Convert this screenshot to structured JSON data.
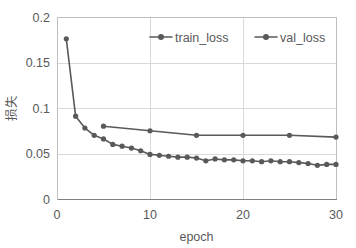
{
  "chart_data": {
    "type": "line",
    "title": "",
    "xlabel": "epoch",
    "ylabel": "损失",
    "xlim": [
      0,
      30
    ],
    "ylim": [
      0,
      0.2
    ],
    "xticks": [
      "0",
      "10",
      "20",
      "30"
    ],
    "xtick_values": [
      0,
      10,
      20,
      30
    ],
    "yticks": [
      "0",
      "0.05",
      "0.1",
      "0.15",
      "0.2"
    ],
    "ytick_values": [
      0,
      0.05,
      0.1,
      0.15,
      0.2
    ],
    "grid": "horizontal-and-vertical",
    "legend_position": "top-center-inside",
    "series": [
      {
        "name": "train_loss",
        "color": "#595959",
        "marker": "circle",
        "marker_every": 1,
        "x": [
          1,
          2,
          3,
          4,
          5,
          6,
          7,
          8,
          9,
          10,
          11,
          12,
          13,
          14,
          15,
          16,
          17,
          18,
          19,
          20,
          21,
          22,
          23,
          24,
          25,
          26,
          27,
          28,
          29,
          30
        ],
        "values": [
          0.176,
          0.091,
          0.078,
          0.07,
          0.066,
          0.06,
          0.058,
          0.056,
          0.053,
          0.049,
          0.048,
          0.047,
          0.046,
          0.046,
          0.045,
          0.042,
          0.044,
          0.043,
          0.043,
          0.042,
          0.042,
          0.041,
          0.042,
          0.041,
          0.041,
          0.04,
          0.039,
          0.037,
          0.038,
          0.038
        ]
      },
      {
        "name": "val_loss",
        "color": "#595959",
        "marker": "circle",
        "marker_every": 5,
        "x": [
          5,
          10,
          15,
          20,
          25,
          30
        ],
        "values": [
          0.08,
          0.075,
          0.07,
          0.07,
          0.07,
          0.068
        ]
      }
    ]
  },
  "legend": {
    "entries": [
      {
        "label": "train_loss"
      },
      {
        "label": "val_loss"
      }
    ]
  },
  "colors": {
    "series": "#595959",
    "grid": "#d9d9d9",
    "axis": "#808080",
    "text": "#595959",
    "background": "#ffffff"
  }
}
